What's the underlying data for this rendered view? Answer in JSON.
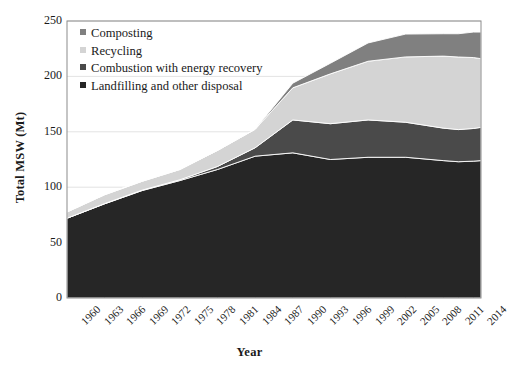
{
  "chart_data": {
    "type": "area",
    "title": "",
    "xlabel": "Year",
    "ylabel": "Total MSW (Mt)",
    "xlim": [
      1960,
      2015
    ],
    "ylim": [
      0,
      250
    ],
    "yticks": [
      0,
      50,
      100,
      150,
      200,
      250
    ],
    "xticks": [
      1960,
      1963,
      1966,
      1969,
      1972,
      1975,
      1978,
      1981,
      1984,
      1987,
      1990,
      1993,
      1996,
      1999,
      2002,
      2005,
      2008,
      2011,
      2014
    ],
    "grid": true,
    "stacked": true,
    "legend_position": "top-left",
    "x": [
      1960,
      1965,
      1970,
      1975,
      1980,
      1985,
      1990,
      1995,
      2000,
      2005,
      2010,
      2012,
      2014,
      2015
    ],
    "series": [
      {
        "name": "Landfilling and other disposal",
        "color": "#262626",
        "stack_order": 1,
        "values": [
          72.0,
          85.0,
          97.0,
          106.0,
          116.0,
          128.0,
          131.0,
          125.0,
          127.0,
          127.0,
          124.0,
          123.0,
          123.5,
          124.0
        ]
      },
      {
        "name": "Combustion with energy recovery",
        "color": "#4a4a4a",
        "stack_order": 2,
        "values": [
          0.0,
          0.2,
          0.4,
          0.7,
          2.7,
          7.6,
          29.7,
          32.3,
          33.7,
          31.6,
          29.3,
          29.0,
          29.5,
          30.0
        ]
      },
      {
        "name": "Recycling",
        "color": "#d4d4d4",
        "stack_order": 3,
        "values": [
          5.6,
          8.0,
          8.0,
          9.3,
          14.5,
          16.7,
          29.0,
          45.0,
          53.0,
          59.0,
          65.0,
          65.5,
          64.0,
          62.0
        ]
      },
      {
        "name": "Composting",
        "color": "#808080",
        "stack_order": 4,
        "values": [
          0.0,
          0.0,
          0.0,
          0.0,
          0.0,
          0.0,
          4.2,
          9.6,
          16.5,
          20.6,
          20.2,
          21.0,
          23.0,
          24.0
        ]
      }
    ],
    "totals": [
      77.6,
      93.2,
      105.4,
      116.0,
      133.2,
      152.3,
      193.9,
      211.9,
      230.2,
      238.2,
      238.5,
      238.5,
      240.0,
      240.0
    ]
  },
  "legend": {
    "items": [
      {
        "label": "Composting",
        "color": "#808080"
      },
      {
        "label": "Recycling",
        "color": "#d4d4d4"
      },
      {
        "label": "Combustion with energy recovery",
        "color": "#4a4a4a"
      },
      {
        "label": "Landfilling and other disposal",
        "color": "#262626"
      }
    ]
  },
  "axes": {
    "y_title": "Total MSW (Mt)",
    "x_title": "Year",
    "y_tick_labels": [
      "250",
      "200",
      "150",
      "100",
      "50",
      "0"
    ],
    "x_tick_labels": [
      "1960",
      "1963",
      "1966",
      "1969",
      "1972",
      "1975",
      "1978",
      "1981",
      "1984",
      "1987",
      "1990",
      "1993",
      "1996",
      "1999",
      "2002",
      "2005",
      "2008",
      "2011",
      "2014"
    ]
  },
  "colors": {
    "composting": "#808080",
    "recycling": "#d4d4d4",
    "combustion": "#4a4a4a",
    "landfilling": "#262626",
    "grid": "#e3e3e3",
    "frame": "#8c8c8c",
    "text": "#1a1a1a"
  }
}
